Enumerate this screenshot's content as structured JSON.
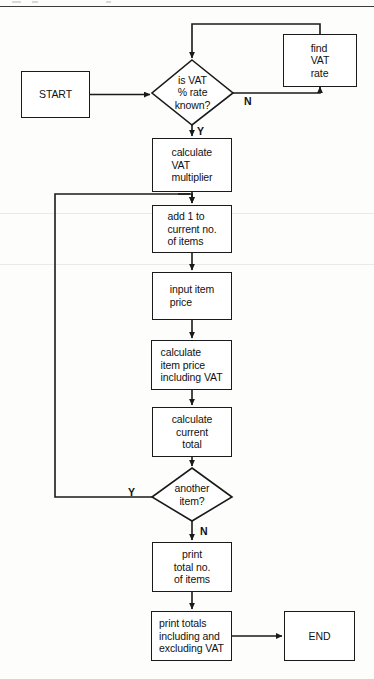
{
  "diagram": {
    "type": "flowchart",
    "stroke_color": "#1a1a1a",
    "fill_color": "#ffffff",
    "text_color": "#111111"
  },
  "nodes": {
    "start": {
      "label": "START",
      "shape": "rectangle"
    },
    "is_vat_known": {
      "label": "is VAT\n% rate\nknown?",
      "shape": "diamond"
    },
    "find_vat_rate": {
      "label": "find\nVAT\nrate",
      "shape": "rectangle"
    },
    "calculate_multiplier": {
      "label": "calculate\nVAT\nmultiplier",
      "shape": "rectangle"
    },
    "add_one_item": {
      "label": "add 1 to\ncurrent no.\nof items",
      "shape": "rectangle"
    },
    "input_price": {
      "label": "input item\nprice",
      "shape": "rectangle"
    },
    "calculate_item_price": {
      "label": "calculate\nitem price\nincluding VAT",
      "shape": "rectangle"
    },
    "calculate_total": {
      "label": "calculate\ncurrent\ntotal",
      "shape": "rectangle"
    },
    "another_item": {
      "label": "another\nitem?",
      "shape": "diamond"
    },
    "print_total_items": {
      "label": "print\ntotal no.\nof items",
      "shape": "rectangle"
    },
    "print_totals": {
      "label": "print totals\nincluding and\nexcluding VAT",
      "shape": "rectangle"
    },
    "end": {
      "label": "END",
      "shape": "rectangle"
    }
  },
  "branch_labels": {
    "vat_no": "N",
    "vat_yes": "Y",
    "another_yes": "Y",
    "another_no": "N"
  }
}
